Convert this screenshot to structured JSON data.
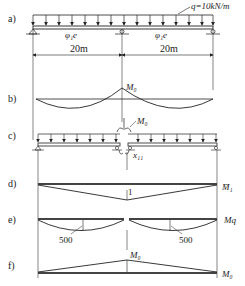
{
  "panels": {
    "a": {
      "label": "a)",
      "load": "q=10kN/m",
      "stiffness_left": "φ₁e",
      "stiffness_right": "φ₁e",
      "span_left": "20m",
      "span_right": "20m"
    },
    "b": {
      "label": "b)",
      "moment": "M₀"
    },
    "c": {
      "label": "c)",
      "moment": "M₀",
      "unknown": "x₁₁"
    },
    "d": {
      "label": "d)",
      "value": "1",
      "diagram": "M̄₁"
    },
    "e": {
      "label": "e)",
      "value_left": "500",
      "value_right": "500",
      "diagram": "Mq"
    },
    "f": {
      "label": "f)",
      "moment": "M₀",
      "diagram": "M₀"
    }
  },
  "colors": {
    "line": "#222222",
    "background": "#ffffff"
  }
}
